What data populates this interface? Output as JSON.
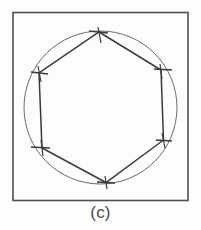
{
  "figure": {
    "caption": "(c)",
    "panel_label": "c",
    "colors": {
      "background": "#fdfdfc",
      "frame_stroke": "#4f4f4f",
      "circle_stroke": "#6b6b6b",
      "polygon_stroke": "#3a3a3a",
      "tick_stroke": "#3a3a3a",
      "caption_text": "#4a4a4a"
    },
    "stroke_widths": {
      "frame": 1.6,
      "circle": 1.0,
      "polygon": 1.5,
      "tick": 1.4
    }
  },
  "chart_data": {
    "type": "diagram",
    "title": "(c)",
    "subtitle": "",
    "xlabel": "",
    "ylabel": "",
    "grid": false,
    "legend": "none",
    "view_box": [
      0,
      0,
      201,
      230
    ],
    "frame": {
      "shape": "square",
      "x": 13,
      "y": 12.5,
      "width": 175,
      "height": 188
    },
    "circle": {
      "cx": 100.5,
      "cy": 107.5,
      "r": 76.5
    },
    "polygon": {
      "sides": 6,
      "name": "hexagon",
      "closed": true,
      "vertices": [
        {
          "id": "v1",
          "label": "top",
          "x": 99,
          "y": 32
        },
        {
          "id": "v2",
          "label": "upper-right",
          "x": 161,
          "y": 70
        },
        {
          "id": "v3",
          "label": "lower-right",
          "x": 163.5,
          "y": 140
        },
        {
          "id": "v4",
          "label": "bottom",
          "x": 106,
          "y": 182.5
        },
        {
          "id": "v5",
          "label": "lower-left",
          "x": 42,
          "y": 148
        },
        {
          "id": "v6",
          "label": "upper-left",
          "x": 39,
          "y": 73
        }
      ]
    },
    "tick_marks": [
      {
        "id": "t1",
        "vertex": "v1",
        "x1": 89,
        "y1": 31,
        "x2": 108,
        "y2": 33
      },
      {
        "id": "t2",
        "vertex": "v2",
        "x1": 154,
        "y1": 69,
        "x2": 172,
        "y2": 70
      },
      {
        "id": "t3",
        "vertex": "v3",
        "x1": 156,
        "y1": 140,
        "x2": 172,
        "y2": 141
      },
      {
        "id": "t4",
        "vertex": "v4",
        "x1": 97,
        "y1": 182,
        "x2": 115,
        "y2": 183
      },
      {
        "id": "t5",
        "vertex": "v5",
        "x1": 31,
        "y1": 147,
        "x2": 50,
        "y2": 148
      },
      {
        "id": "t6",
        "vertex": "v6",
        "x1": 31,
        "y1": 72,
        "x2": 48,
        "y2": 74
      }
    ],
    "vertex_whiskers": [
      {
        "id": "w1",
        "vertex": "v1",
        "x1": 98,
        "y1": 27,
        "x2": 101,
        "y2": 43
      },
      {
        "id": "w2",
        "vertex": "v2",
        "x1": 160,
        "y1": 64,
        "x2": 162,
        "y2": 79
      },
      {
        "id": "w3",
        "vertex": "v3",
        "x1": 162,
        "y1": 133,
        "x2": 165,
        "y2": 148
      },
      {
        "id": "w4",
        "vertex": "v4",
        "x1": 105,
        "y1": 176,
        "x2": 107,
        "y2": 189
      },
      {
        "id": "w5",
        "vertex": "v5",
        "x1": 41,
        "y1": 140,
        "x2": 43,
        "y2": 156
      },
      {
        "id": "w6",
        "vertex": "v6",
        "x1": 38,
        "y1": 66,
        "x2": 41,
        "y2": 82
      }
    ]
  }
}
